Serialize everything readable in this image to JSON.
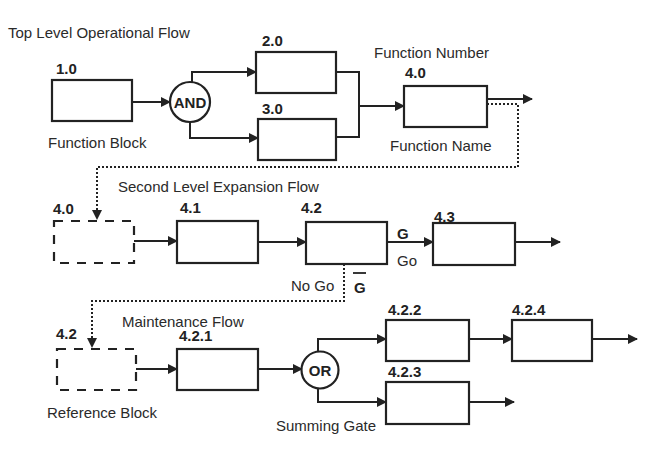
{
  "diagram": {
    "type": "functional flow block diagram",
    "sections": {
      "top": {
        "title": "Top Level Operational Flow"
      },
      "second": {
        "title": "Second Level Expansion Flow"
      },
      "maintenance": {
        "title": "Maintenance Flow"
      }
    },
    "annotations": {
      "function_block": "Function Block",
      "function_number": "Function Number",
      "function_name": "Function Name",
      "reference_block": "Reference Block",
      "summing_gate": "Summing Gate",
      "go_symbol": "G",
      "go_label": "Go",
      "no_go_label": "No Go",
      "no_go_symbol": "G"
    },
    "gates": {
      "and": "AND",
      "or": "OR"
    },
    "blocks": {
      "b1_0": "1.0",
      "b2_0": "2.0",
      "b3_0": "3.0",
      "b4_0": "4.0",
      "ref4_0": "4.0",
      "b4_1": "4.1",
      "b4_2": "4.2",
      "b4_3": "4.3",
      "ref4_2": "4.2",
      "b4_2_1": "4.2.1",
      "b4_2_2": "4.2.2",
      "b4_2_3": "4.2.3",
      "b4_2_4": "4.2.4"
    },
    "colors": {
      "ink": "#222222",
      "background": "#ffffff"
    }
  }
}
